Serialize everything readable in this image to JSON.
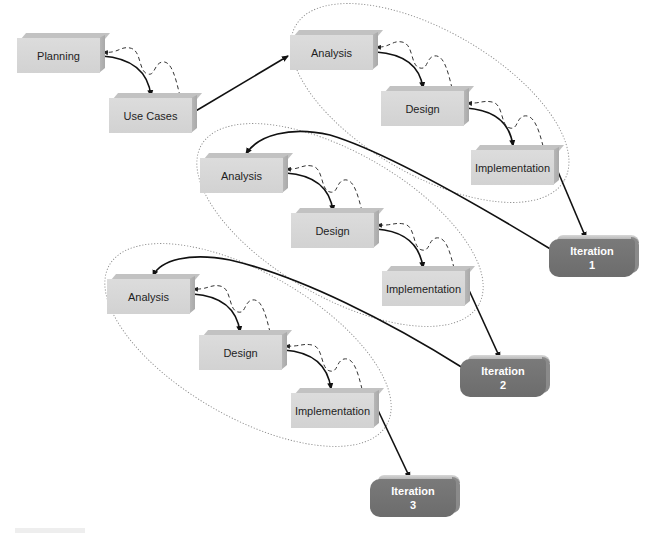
{
  "diagram": {
    "type": "iterative-development-process",
    "colors": {
      "box_face": "#d6d6d6",
      "box_side": "#b0b0b0",
      "iteration_fill": "#737373",
      "iteration_text": "#ffffff",
      "arrow": "#111111",
      "feedback_dashed": "#333333",
      "ellipse_dotted": "#888888"
    },
    "nodes": {
      "planning": {
        "label": "Planning"
      },
      "use_cases": {
        "label": "Use Cases"
      },
      "iter1": {
        "analysis": "Analysis",
        "design": "Design",
        "implementation": "Implementation"
      },
      "iter2": {
        "analysis": "Analysis",
        "design": "Design",
        "implementation": "Implementation"
      },
      "iter3": {
        "analysis": "Analysis",
        "design": "Design",
        "implementation": "Implementation"
      }
    },
    "iterations": [
      {
        "line1": "Iteration",
        "line2": "1"
      },
      {
        "line1": "Iteration",
        "line2": "2"
      },
      {
        "line1": "Iteration",
        "line2": "3"
      }
    ],
    "edges": [
      {
        "from": "Planning",
        "to": "Use Cases",
        "style": "solid-arrow"
      },
      {
        "from": "Use Cases",
        "to": "Planning",
        "style": "dashed-feedback"
      },
      {
        "from": "Use Cases",
        "to": "Analysis (1)",
        "style": "solid-arrow"
      },
      {
        "from": "Analysis (1)",
        "to": "Design (1)",
        "style": "solid-arrow"
      },
      {
        "from": "Design (1)",
        "to": "Implementation (1)",
        "style": "solid-arrow"
      },
      {
        "from": "Implementation (1)",
        "to": "Iteration 1",
        "style": "solid-arrow"
      },
      {
        "from": "Iteration 1",
        "to": "Analysis (2)",
        "style": "solid-arrow"
      },
      {
        "from": "Analysis (2)",
        "to": "Design (2)",
        "style": "solid-arrow"
      },
      {
        "from": "Design (2)",
        "to": "Implementation (2)",
        "style": "solid-arrow"
      },
      {
        "from": "Implementation (2)",
        "to": "Iteration 2",
        "style": "solid-arrow"
      },
      {
        "from": "Iteration 2",
        "to": "Analysis (3)",
        "style": "solid-arrow"
      },
      {
        "from": "Analysis (3)",
        "to": "Design (3)",
        "style": "solid-arrow"
      },
      {
        "from": "Design (3)",
        "to": "Implementation (3)",
        "style": "solid-arrow"
      },
      {
        "from": "Implementation (3)",
        "to": "Iteration 3",
        "style": "solid-arrow"
      }
    ]
  }
}
